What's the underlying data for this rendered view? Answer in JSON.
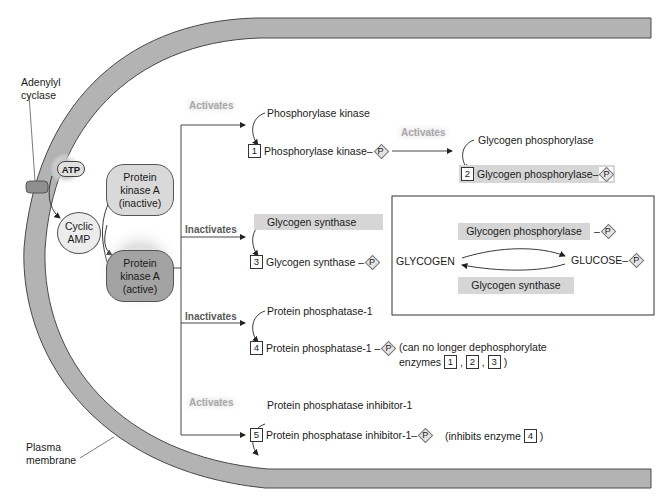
{
  "membrane": {
    "label_adenylyl": "Adenylyl\ncyclase",
    "label_adenylyl_l1": "Adenylyl",
    "label_adenylyl_l2": "cyclase",
    "label_plasma_l1": "Plasma",
    "label_plasma_l2": "membrane",
    "fill_color": "#b3b3b3",
    "edge_color": "#4a4a4a"
  },
  "signaling": {
    "atp": "ATP",
    "cyclic_amp_l1": "Cyclic",
    "cyclic_amp_l2": "AMP",
    "pka_inactive_l1": "Protein",
    "pka_inactive_l2": "kinase A",
    "pka_inactive_l3": "(inactive)",
    "pka_active_l1": "Protein",
    "pka_active_l2": "kinase A",
    "pka_active_l3": "(active)"
  },
  "branches": [
    {
      "action": "Activates",
      "substrate": "Phosphorylase kinase",
      "number": "1",
      "product": "Phosphorylase kinase",
      "phospho": "P"
    },
    {
      "action": "Inactivates",
      "substrate": "Glycogen synthase",
      "number": "3",
      "product": "Glycogen synthase",
      "phospho": "P"
    },
    {
      "action": "Inactivates",
      "substrate": "Protein phosphatase-1",
      "number": "4",
      "product": "Protein phosphatase-1",
      "phospho": "P",
      "note_l1": "(can no longer dephosphorylate",
      "note_l2_prefix": "enzymes",
      "note_refs": [
        "1",
        "2",
        "3"
      ],
      "note_suffix": ")"
    },
    {
      "action": "Activates",
      "substrate": "Protein phosphatase inhibitor-1",
      "number": "5",
      "product": "Protein phosphatase inhibitor-1",
      "phospho": "P",
      "note_prefix": "(inhibits enzyme",
      "note_ref": "4",
      "note_suffix": ")"
    }
  ],
  "secondary": {
    "action": "Activates",
    "substrate": "Glycogen phosphorylase",
    "number": "2",
    "product": "Glycogen phosphorylase",
    "phospho": "P"
  },
  "inset": {
    "top_enzyme": "Glycogen phosphorylase",
    "top_phospho": "P",
    "left": "GLYCOGEN",
    "right": "GLUCOSE",
    "right_phospho": "P",
    "bottom_enzyme": "Glycogen synthase"
  }
}
